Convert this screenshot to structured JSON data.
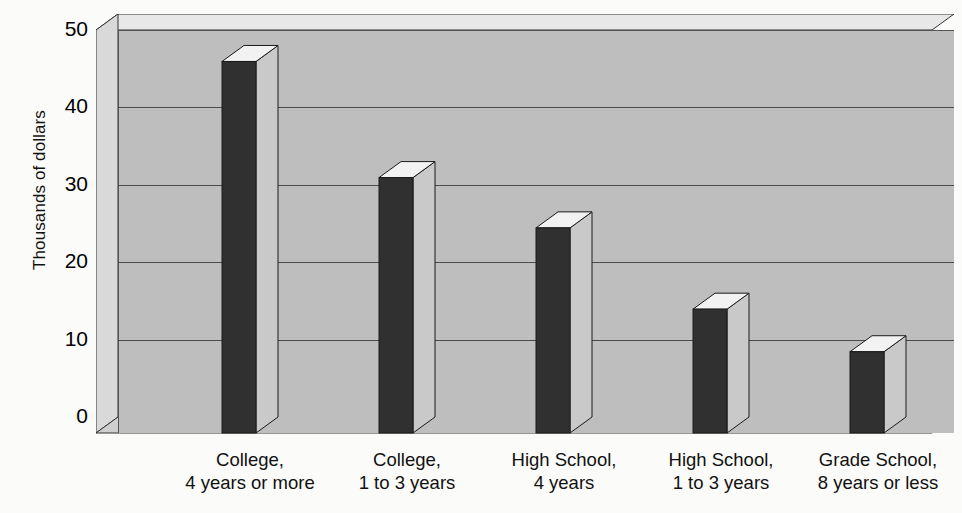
{
  "chart_data": {
    "type": "bar",
    "title": "",
    "subtitle": "",
    "xlabel": "",
    "ylabel": "Thousands of dollars",
    "ylim": [
      0,
      50
    ],
    "ytick_values": [
      50,
      40,
      30,
      20,
      10,
      0
    ],
    "ytick_labels": [
      "50",
      "40",
      "30",
      "20",
      "10",
      "0"
    ],
    "grid": true,
    "legend": "none",
    "style": "3d-column",
    "categories": [
      "College, 4 years or more",
      "College, 1 to 3 years",
      "High School, 4 years",
      "High School, 1 to 3 years",
      "Grade School, 8 years or less"
    ],
    "category_lines": [
      [
        "College,",
        "4 years or more"
      ],
      [
        "College,",
        "1 to 3 years"
      ],
      [
        "High School,",
        "4 years"
      ],
      [
        "High School,",
        "1 to 3 years"
      ],
      [
        "Grade School,",
        "8 years or less"
      ]
    ],
    "values": [
      48,
      33,
      26.5,
      16,
      10.5
    ],
    "colors": {
      "bar_front": "#303030",
      "bar_top": "#f2f2f2",
      "bar_side": "#c9c9c9",
      "plot_back_wall": "#bebebe",
      "plot_side_wall": "#d9d9d9",
      "plot_top_face": "#e8e8e8",
      "floor": "#cfcfcf",
      "gridline": "#4b4b4b",
      "outline": "#333333",
      "background": "#fbfbf9",
      "text": "#111111"
    }
  },
  "axis": {
    "y_title": "Thousands of dollars"
  }
}
